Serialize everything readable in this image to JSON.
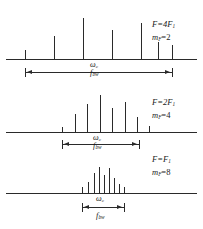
{
  "figure": {
    "type": "spectrum-diagram",
    "background": "#ffffff",
    "line_color": "#2a2a2a",
    "width": 203,
    "height": 229
  },
  "panels": [
    {
      "id": "panel-top",
      "label_F": "F=4F",
      "label_F_sub": "1",
      "label_m": "m",
      "label_m_sub": "F",
      "label_m_val": "=2",
      "center_label": "ω",
      "center_label_sub": "c",
      "bandwidth_label": "f",
      "bandwidth_label_sub": "bw",
      "baseline_y": 59,
      "baseline_x": 6,
      "baseline_w": 191,
      "arrow_y": 72,
      "arrow_x": 25,
      "arrow_w": 147,
      "spikes": [
        {
          "x": 25,
          "h": 9
        },
        {
          "x": 54,
          "h": 23
        },
        {
          "x": 83,
          "h": 41
        },
        {
          "x": 112,
          "h": 29
        },
        {
          "x": 141,
          "h": 36
        },
        {
          "x": 158,
          "h": 17
        },
        {
          "x": 172,
          "h": 14
        }
      ]
    },
    {
      "id": "panel-middle",
      "label_F": "F=2F",
      "label_F_sub": "1",
      "label_m": "m",
      "label_m_sub": "F",
      "label_m_val": "=4",
      "center_label": "ω",
      "center_label_sub": "c",
      "bandwidth_label": "f",
      "bandwidth_label_sub": "bw",
      "baseline_y": 132,
      "baseline_x": 6,
      "baseline_w": 191,
      "arrow_y": 144,
      "arrow_x": 62,
      "arrow_w": 77,
      "spikes": [
        {
          "x": 62,
          "h": 5
        },
        {
          "x": 75,
          "h": 18
        },
        {
          "x": 87,
          "h": 28
        },
        {
          "x": 100,
          "h": 37
        },
        {
          "x": 112,
          "h": 24
        },
        {
          "x": 125,
          "h": 30
        },
        {
          "x": 137,
          "h": 15
        },
        {
          "x": 149,
          "h": 6
        }
      ]
    },
    {
      "id": "panel-bottom",
      "label_F": "F=F",
      "label_F_sub": "1",
      "label_m": "m",
      "label_m_sub": "F",
      "label_m_val": "=8",
      "center_label": "ω",
      "center_label_sub": "c",
      "bandwidth_label": "f",
      "bandwidth_label_sub": "bw",
      "baseline_y": 193,
      "baseline_x": 6,
      "baseline_w": 191,
      "arrow_y": 207,
      "arrow_x": 82,
      "arrow_w": 42,
      "spikes": [
        {
          "x": 82,
          "h": 6
        },
        {
          "x": 88,
          "h": 11
        },
        {
          "x": 94,
          "h": 20
        },
        {
          "x": 99,
          "h": 26
        },
        {
          "x": 104,
          "h": 18
        },
        {
          "x": 109,
          "h": 25
        },
        {
          "x": 114,
          "h": 15
        },
        {
          "x": 119,
          "h": 9
        },
        {
          "x": 124,
          "h": 6
        }
      ]
    }
  ],
  "side_labels": [
    {
      "x": 152,
      "y": 20,
      "F_y": 20,
      "m_y": 33
    },
    {
      "x": 152,
      "y": 98,
      "F_y": 98,
      "m_y": 111
    },
    {
      "x": 152,
      "y": 155,
      "F_y": 155,
      "m_y": 168
    }
  ],
  "center_marks": [
    {
      "omega_x": 90,
      "omega_y": 61,
      "fbw_x": 90,
      "fbw_y": 68
    },
    {
      "omega_x": 93,
      "omega_y": 134,
      "fbw_x": 93,
      "fbw_y": 141
    },
    {
      "omega_x": 96,
      "omega_y": 195,
      "fbw_x": 96,
      "fbw_y": 211
    }
  ]
}
